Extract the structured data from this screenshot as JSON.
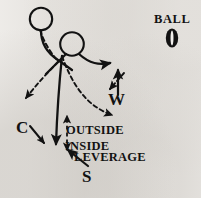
{
  "diagram": {
    "background_color": "#f1efec",
    "ink_color": "#121212",
    "labels": {
      "ball": "BALL",
      "wide_receiver": "W",
      "corner": "C",
      "safety": "S",
      "outside": "OUTSIDE",
      "inside": "INSIDE",
      "leverage": "LEVERAGE"
    },
    "icons": {
      "ball": "football-oval-icon",
      "player_head_back": "player-head-circle-icon",
      "player_head_front": "player-head-circle-icon"
    },
    "legend_notes": {
      "solid_line": "defender path",
      "dashed_line": "receiver path"
    }
  }
}
